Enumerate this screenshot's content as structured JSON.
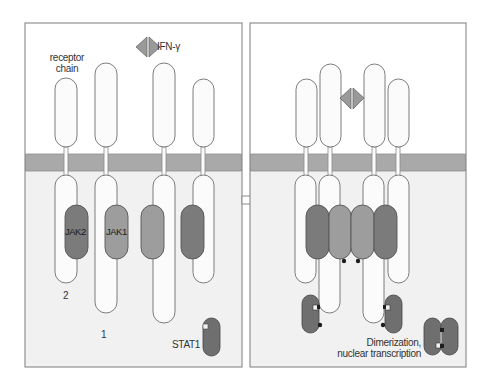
{
  "figure": {
    "colors": {
      "background": "#ffffff",
      "extracellular": "#ffffff",
      "cytoplasm": "#f1f1f1",
      "membrane": "#a9a9a9",
      "panel_border": "#7d7d7d",
      "receptor_fill": "#fbfbfb",
      "receptor_stroke": "#6e6e6e",
      "jak_dark": "#7b7b7b",
      "jak_light": "#9d9d9d",
      "stat": "#6f6f6f",
      "ligand": "#9a9a9a",
      "phosphate": "#1e1e1e"
    }
  },
  "left_panel": {
    "ligand_label": "IFN-γ",
    "receptor_label_line1": "receptor",
    "receptor_label_line2": "chain",
    "jak2_label": "JAK2",
    "jak1_label": "JAK1",
    "chain2_label": "2",
    "chain1_label": "1",
    "stat_label": "STAT1"
  },
  "transition_arrow": {
    "icon": "right-arrow-icon"
  },
  "right_panel": {
    "outcome_line1": "Dimerization,",
    "outcome_line2": "nuclear transcription"
  }
}
